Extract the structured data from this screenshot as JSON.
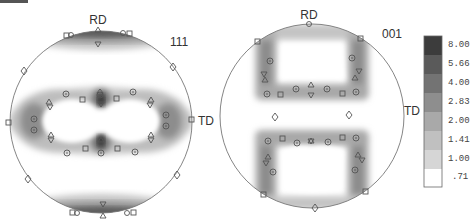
{
  "figure": {
    "type": "pole_figure_pair",
    "panels": [
      {
        "id": "111",
        "plane_label": "111",
        "rd_label": "RD",
        "td_label": "TD",
        "center": [
          101,
          122
        ],
        "radius": 91
      },
      {
        "id": "001",
        "plane_label": "001",
        "rd_label": "RD",
        "td_label": "TD",
        "center": [
          312,
          116
        ],
        "radius": 92
      }
    ],
    "marker_legend_symbols": [
      "square",
      "circle-dot",
      "triangle-up",
      "triangle-down",
      "diamond"
    ]
  },
  "legend": {
    "title": "",
    "levels": [
      "8.00",
      "5.66",
      "4.00",
      "2.83",
      "2.00",
      "1.41",
      "1.00",
      ".71"
    ],
    "colors": [
      "#3c3c3c",
      "#5a5a5a",
      "#737373",
      "#8e8e8e",
      "#a9a9a9",
      "#c0c0c0",
      "#d6d6d6",
      "#ffffff"
    ]
  }
}
